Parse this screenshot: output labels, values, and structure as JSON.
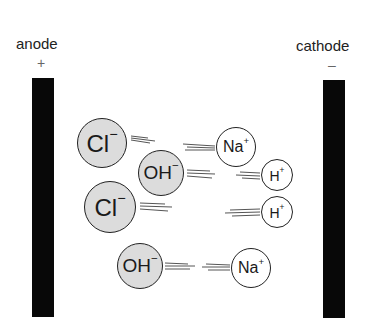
{
  "diagram": {
    "anode": {
      "label": "anode",
      "sign": "+"
    },
    "cathode": {
      "label": "cathode",
      "sign": "–"
    },
    "ions": [
      {
        "id": "cl-1",
        "symbol": "Cl",
        "charge": "−",
        "type": "anion",
        "cx": 102,
        "cy": 143,
        "r": 25
      },
      {
        "id": "oh-1",
        "symbol": "OH",
        "charge": "−",
        "type": "anion",
        "cx": 161,
        "cy": 173,
        "r": 23
      },
      {
        "id": "cl-2",
        "symbol": "Cl",
        "charge": "−",
        "type": "anion",
        "cx": 110,
        "cy": 207,
        "r": 26
      },
      {
        "id": "oh-2",
        "symbol": "OH",
        "charge": "−",
        "type": "anion",
        "cx": 140,
        "cy": 266,
        "r": 23
      },
      {
        "id": "na-1",
        "symbol": "Na",
        "charge": "+",
        "type": "cation",
        "cx": 236,
        "cy": 147,
        "r": 20
      },
      {
        "id": "h-1",
        "symbol": "H",
        "charge": "+",
        "type": "cation",
        "cx": 277,
        "cy": 175,
        "r": 16
      },
      {
        "id": "h-2",
        "symbol": "H",
        "charge": "+",
        "type": "cation",
        "cx": 277,
        "cy": 212,
        "r": 16
      },
      {
        "id": "na-2",
        "symbol": "Na",
        "charge": "+",
        "type": "cation",
        "cx": 251,
        "cy": 268,
        "r": 20
      }
    ],
    "colors": {
      "electrode": "#080808",
      "anion_fill": "#dcdcdc",
      "cation_fill": "#ffffff"
    }
  }
}
